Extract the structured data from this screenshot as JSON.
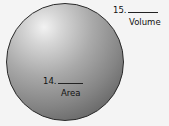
{
  "figure": {
    "shape": "sphere",
    "labels": [
      {
        "number": "15.",
        "caption": "Volume"
      },
      {
        "number": "14.",
        "caption": "Area"
      }
    ]
  }
}
